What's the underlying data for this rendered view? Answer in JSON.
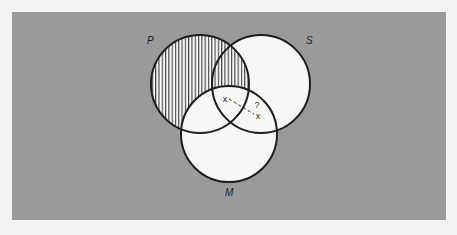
{
  "diagram": {
    "type": "venn",
    "colors": {
      "page": "#f3f3f3",
      "panel": "#9a9a9a",
      "circle_fill": "#f7f7f7",
      "stroke": "#1e1e1e",
      "hatch": "#2a2a2a"
    },
    "panel": {
      "x": 12,
      "y": 12,
      "width": 434,
      "height": 208
    },
    "circles": [
      {
        "id": "P",
        "label": "P",
        "cx": 200,
        "cy": 84,
        "r": 49,
        "label_x": 147,
        "label_y": 44
      },
      {
        "id": "S",
        "label": "S",
        "cx": 261,
        "cy": 84,
        "r": 49,
        "label_x": 306,
        "label_y": 44
      },
      {
        "id": "M",
        "label": "M",
        "cx": 229,
        "cy": 134,
        "r": 48,
        "label_x": 225,
        "label_y": 196
      }
    ],
    "shaded_region": {
      "description": "P outside M (vertical hatching)",
      "pattern": "vertical-lines",
      "spacing": 3.3
    },
    "marks": {
      "x1": {
        "symbol": "x",
        "x": 225,
        "y": 100
      },
      "x2": {
        "symbol": "x",
        "x": 258,
        "y": 117
      },
      "question": {
        "symbol": "?",
        "x": 257,
        "y": 108
      },
      "connector": "dashed"
    }
  }
}
